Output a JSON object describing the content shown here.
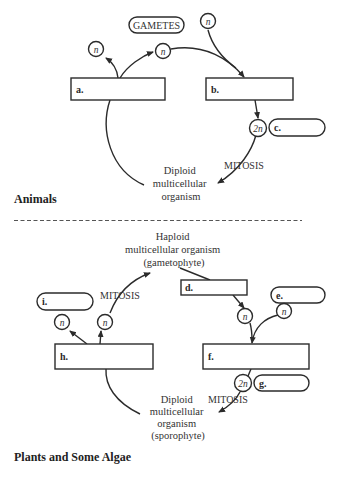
{
  "animals": {
    "title": "Animals",
    "gametes_label": "GAMETES",
    "box_a": "a.",
    "box_b": "b.",
    "pill_c": "c.",
    "n_symbol": "n",
    "twon_symbol": "2n",
    "mitosis": "MITOSIS",
    "organism": [
      "Diploid",
      "multicellular",
      "organism"
    ]
  },
  "plants": {
    "title": "Plants and Some Algae",
    "haploid_organism": [
      "Haploid",
      "multicellular organism",
      "(gametophyte)"
    ],
    "box_d": "d.",
    "pill_e": "e.",
    "box_f": "f.",
    "pill_g": "g.",
    "box_h": "h.",
    "pill_i": "i.",
    "n_symbol": "n",
    "twon_symbol": "2n",
    "mitosis_top": "MITOSIS",
    "mitosis_bottom": "MITOSIS",
    "diploid_organism": [
      "Diploid",
      "multicellular",
      "organism",
      "(sporophyte)"
    ]
  }
}
